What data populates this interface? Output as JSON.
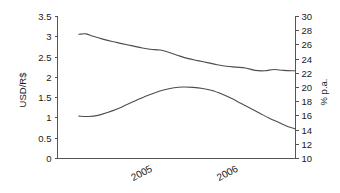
{
  "chart_data": {
    "type": "line",
    "title": "",
    "subtitle": "",
    "xlabel": "",
    "ylabel": "USD/R$",
    "y2label": "% p.a.",
    "grid": false,
    "legend": "none",
    "x_tick_labels": [
      "2005",
      "2006"
    ],
    "x_tick_positions": [
      0.36,
      0.72
    ],
    "xlim": [
      0,
      1
    ],
    "ylim": [
      0,
      3.5
    ],
    "y2lim": [
      10,
      30
    ],
    "y_ticks": [
      "0",
      "0.5",
      "1",
      "1.5",
      "2",
      "2.5",
      "3",
      "3.5"
    ],
    "y_tick_values": [
      0,
      0.5,
      1,
      1.5,
      2,
      2.5,
      3,
      3.5
    ],
    "y2_ticks": [
      "10",
      "12",
      "14",
      "16",
      "18",
      "20",
      "22",
      "24",
      "26",
      "28",
      "30"
    ],
    "y2_tick_values": [
      10,
      12,
      14,
      16,
      18,
      20,
      22,
      24,
      26,
      28,
      30
    ],
    "series": [
      {
        "name": "USD/R$ exchange rate",
        "axis": "left",
        "color": "#4d4d4d",
        "x": [
          0.09,
          0.12,
          0.15,
          0.19,
          0.23,
          0.27,
          0.31,
          0.35,
          0.39,
          0.43,
          0.47,
          0.51,
          0.55,
          0.59,
          0.63,
          0.67,
          0.71,
          0.75,
          0.79,
          0.83,
          0.87,
          0.91,
          0.95,
          1.0
        ],
        "values": [
          3.05,
          3.06,
          3.0,
          2.93,
          2.87,
          2.82,
          2.77,
          2.72,
          2.68,
          2.66,
          2.6,
          2.52,
          2.45,
          2.4,
          2.35,
          2.3,
          2.26,
          2.24,
          2.22,
          2.16,
          2.15,
          2.18,
          2.16,
          2.15
        ]
      },
      {
        "name": "Interest rate (% p.a.)",
        "axis": "right",
        "color": "#4d4d4d",
        "x": [
          0.09,
          0.13,
          0.17,
          0.21,
          0.25,
          0.29,
          0.33,
          0.37,
          0.41,
          0.45,
          0.49,
          0.53,
          0.57,
          0.61,
          0.65,
          0.69,
          0.73,
          0.77,
          0.81,
          0.85,
          0.89,
          0.93,
          0.97,
          1.0
        ],
        "values": [
          15.9,
          15.85,
          16.0,
          16.4,
          16.9,
          17.5,
          18.1,
          18.7,
          19.2,
          19.6,
          19.9,
          20.0,
          19.95,
          19.8,
          19.5,
          19.0,
          18.4,
          17.7,
          17.0,
          16.3,
          15.6,
          15.0,
          14.4,
          14.1
        ]
      }
    ]
  },
  "axes": {
    "left_title": "USD/R$",
    "right_title": "% p.a."
  }
}
